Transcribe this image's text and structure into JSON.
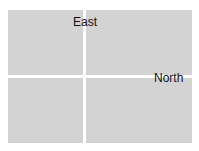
{
  "image": {
    "description": "Gray rectangular panel divided into four quadrants by thin white lines, with two direction labels",
    "labels": {
      "east": "East",
      "north": "North"
    },
    "colors": {
      "panel": "#d3d3d3",
      "divider": "#ffffff",
      "text": "#111111"
    }
  }
}
